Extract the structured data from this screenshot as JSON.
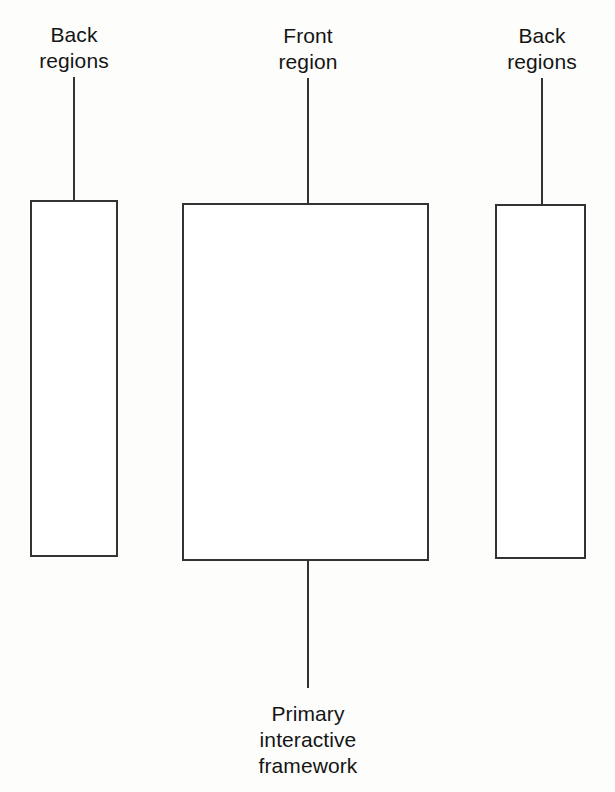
{
  "diagram": {
    "type": "block-diagram",
    "style": {
      "stroke_color": "#333333",
      "background_color": "#fdfdfc",
      "box_fill": "#ffffff",
      "text_color": "#151515",
      "stroke_width_px": 2
    },
    "nodes": [
      {
        "id": "back-regions-left",
        "label": "Back\nregions",
        "label_lines": [
          "Back",
          "regions"
        ],
        "box": {
          "x": 30,
          "y": 200,
          "width": 88,
          "height": 357
        },
        "connector": {
          "x": 74,
          "y_top": 77,
          "y_bottom": 200
        },
        "label_position": {
          "x": 74,
          "y": 22
        }
      },
      {
        "id": "front-region",
        "label": "Front\nregion",
        "label_lines": [
          "Front",
          "region"
        ],
        "box": {
          "x": 182,
          "y": 203,
          "width": 247,
          "height": 358
        },
        "connector": {
          "x": 308,
          "y_top": 78,
          "y_bottom": 203
        },
        "label_position": {
          "x": 308,
          "y": 23
        }
      },
      {
        "id": "back-regions-right",
        "label": "Back\nregions",
        "label_lines": [
          "Back",
          "regions"
        ],
        "box": {
          "x": 495,
          "y": 204,
          "width": 91,
          "height": 355
        },
        "connector": {
          "x": 542,
          "y_top": 78,
          "y_bottom": 204
        },
        "label_position": {
          "x": 542,
          "y": 23
        }
      }
    ],
    "bottom_caption": {
      "id": "primary-interactive-framework",
      "label": "Primary\ninteractive\nframework",
      "label_lines": [
        "Primary",
        "interactive",
        "framework"
      ],
      "connector": {
        "x": 308,
        "y_top": 561,
        "y_bottom": 688
      },
      "label_position": {
        "x": 308,
        "y": 701
      }
    }
  }
}
